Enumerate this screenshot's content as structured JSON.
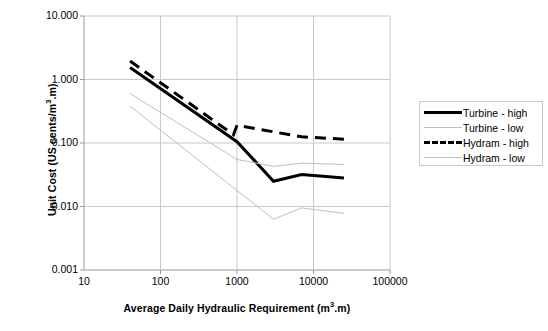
{
  "chart_data": {
    "type": "line",
    "title": "",
    "xlabel_parts": {
      "pre": "Average Daily Hydraulic Requirement (m",
      "sup": "3",
      "post": ".m)"
    },
    "ylabel_parts": {
      "pre": "Unit Cost (US cents/m",
      "sup": "3",
      "post": ".m)"
    },
    "xlabel": "Average Daily Hydraulic Requirement (m3.m)",
    "ylabel": "Unit Cost (US cents/m3 .m)",
    "xscale": "log",
    "yscale": "log",
    "xlim": [
      10,
      100000
    ],
    "ylim": [
      0.001,
      10
    ],
    "xticks": [
      10,
      100,
      1000,
      10000,
      100000
    ],
    "xtick_labels": [
      "10",
      "100",
      "1000",
      "10000",
      "100000"
    ],
    "yticks": [
      0.001,
      0.01,
      0.1,
      1,
      10
    ],
    "ytick_labels": [
      "0.001",
      "0.010",
      "0.100",
      "1.000",
      "10.000"
    ],
    "grid": true,
    "grid_color": "#c9c9c9",
    "legend_position": "right",
    "series": [
      {
        "name": "Turbine - high",
        "style": "solid",
        "width": 3,
        "color": "#000000",
        "x": [
          40,
          1000,
          3000,
          7000,
          25000
        ],
        "y": [
          1.55,
          0.105,
          0.025,
          0.032,
          0.028
        ]
      },
      {
        "name": "Turbine - low",
        "style": "solid",
        "width": 1,
        "color": "#bfbfbf",
        "x": [
          40,
          1000,
          3000,
          7000,
          25000
        ],
        "y": [
          0.6,
          0.055,
          0.043,
          0.048,
          0.046
        ]
      },
      {
        "name": "Hydram - high",
        "style": "dashed",
        "width": 3,
        "color": "#000000",
        "x": [
          40,
          900,
          1000,
          7000,
          25000
        ],
        "y": [
          1.95,
          0.135,
          0.19,
          0.125,
          0.115
        ]
      },
      {
        "name": "Hydram - low",
        "style": "solid",
        "width": 1,
        "color": "#bfbfbf",
        "x": [
          40,
          3000,
          7000,
          25000
        ],
        "y": [
          0.38,
          0.0063,
          0.0095,
          0.0078
        ]
      }
    ]
  },
  "legend": {
    "items": [
      {
        "label": "Turbine - high",
        "swatch": "solid-thick-black-line-icon"
      },
      {
        "label": "Turbine - low",
        "swatch": "solid-thin-gray-line-icon"
      },
      {
        "label": "Hydram - high",
        "swatch": "dashed-thick-black-line-icon"
      },
      {
        "label": "Hydram - low",
        "swatch": "solid-thin-gray-line-icon"
      }
    ]
  }
}
